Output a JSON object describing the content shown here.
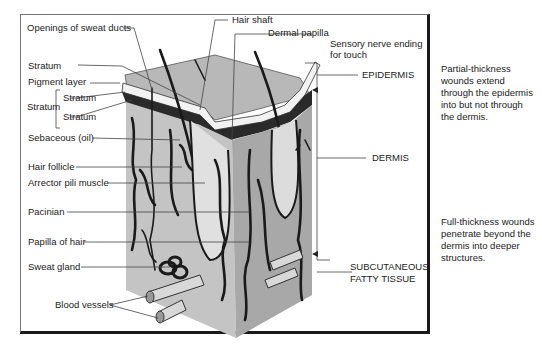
{
  "labels": {
    "openings_sweat_ducts": "Openings of sweat ducts",
    "hair_shaft": "Hair shaft",
    "dermal_papilla": "Dermal papilla",
    "sensory_nerve_1": "Sensory nerve ending",
    "sensory_nerve_2": "for touch",
    "stratum_top": "Stratum",
    "pigment_layer": "Pigment layer",
    "stratum_group": "Stratum",
    "stratum_sub1": "Stratum",
    "stratum_sub2": "Stratum",
    "sebaceous": "Sebaceous (oil)",
    "hair_follicle": "Hair follicle",
    "arrector_pili": "Arrector pili muscle",
    "pacinian": "Pacinian",
    "papilla_of_hair": "Papilla of hair",
    "sweat_gland": "Sweat gland",
    "blood_vessels": "Blood vessels",
    "epidermis": "EPIDERMIS",
    "dermis": "DERMIS",
    "subcutaneous_1": "SUBCUTANEOUS",
    "subcutaneous_2": "FATTY TISSUE"
  },
  "notes": {
    "partial": [
      "Partial-thickness",
      "wounds extend",
      "through the epidermis",
      "into but not through",
      "the dermis."
    ],
    "full": [
      "Full-thickness wounds",
      "penetrate beyond the",
      "dermis into deeper",
      "structures."
    ]
  },
  "colors": {
    "skin_top": "#b8b8b8",
    "front_face": "#c4c4c4",
    "side_face": "#a8a8a8",
    "ink": "#1a1a1a"
  }
}
